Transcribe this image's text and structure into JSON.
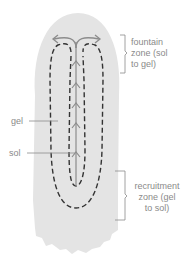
{
  "diagram": {
    "type": "amoeba pseudopod cytoplasmic streaming",
    "colors": {
      "cell_fill": "#e4e4e4",
      "dashed_line": "#333333",
      "arrow": "#8c8c8c",
      "bracket": "#8a8a8a",
      "label_text": "#8a8a8a"
    },
    "labels": {
      "gel": "gel",
      "sol": "sol",
      "fountain_zone": [
        "fountain",
        "zone (sol",
        "to gel)"
      ],
      "recruitment_zone": [
        "recruitment",
        "zone (gel",
        "to sol)"
      ]
    }
  }
}
